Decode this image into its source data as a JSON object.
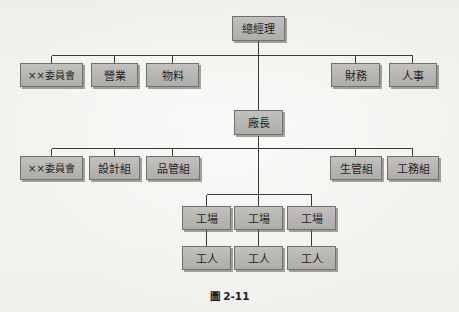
{
  "figure": {
    "caption": "圖 2-11",
    "caption_label": "Figure 2-11"
  },
  "colors": {
    "box_fill": "#b6b5b1",
    "box_border": "#6f6f6b",
    "box_shadow": "#5a5a58",
    "line": "#3a3a38",
    "page_background": "#f3f2ef",
    "text": "#1b1b1b"
  },
  "org_chart": {
    "title": "圖 2-11",
    "type": "organization-chart",
    "levels": [
      {
        "level": 1,
        "nodes": [
          {
            "id": "general-manager",
            "label": "總經理"
          }
        ]
      },
      {
        "level": 2,
        "parent": "general-manager",
        "nodes": [
          {
            "id": "committee-1",
            "label": "××委員會"
          },
          {
            "id": "sales",
            "label": "營業"
          },
          {
            "id": "materials",
            "label": "物料"
          },
          {
            "id": "finance",
            "label": "財務"
          },
          {
            "id": "personnel",
            "label": "人事"
          }
        ]
      },
      {
        "level": 3,
        "parent": "general-manager",
        "nodes": [
          {
            "id": "plant-manager",
            "label": "廠長"
          }
        ]
      },
      {
        "level": 4,
        "parent": "plant-manager",
        "nodes": [
          {
            "id": "committee-2",
            "label": "××委員會"
          },
          {
            "id": "design-group",
            "label": "設計組"
          },
          {
            "id": "quality-control-group",
            "label": "品管組"
          },
          {
            "id": "production-control-group",
            "label": "生管組"
          },
          {
            "id": "engineering-group",
            "label": "工務組"
          }
        ]
      },
      {
        "level": 5,
        "parent": "plant-manager",
        "nodes": [
          {
            "id": "workshop-1",
            "label": "工場"
          },
          {
            "id": "workshop-2",
            "label": "工場"
          },
          {
            "id": "workshop-3",
            "label": "工場"
          }
        ]
      },
      {
        "level": 6,
        "nodes": [
          {
            "id": "worker-1",
            "label": "工人",
            "parent": "workshop-1"
          },
          {
            "id": "worker-2",
            "label": "工人",
            "parent": "workshop-2"
          },
          {
            "id": "worker-3",
            "label": "工人",
            "parent": "workshop-3"
          }
        ]
      }
    ]
  }
}
